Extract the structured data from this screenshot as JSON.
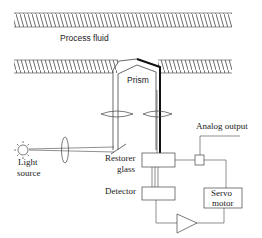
{
  "diagram": {
    "type": "refractometer schematic",
    "labels": {
      "process_fluid": "Process fluid",
      "prism": "Prism",
      "analog_output": "Analog output",
      "light_source_1": "Light",
      "light_source_2": "source",
      "restorer_1": "Restorer",
      "restorer_2": "glass",
      "detector": "Detector",
      "servo_1": "Servo",
      "servo_2": "motor"
    },
    "components": [
      "process-pipe-top-wall",
      "process-pipe-bottom-wall",
      "prism",
      "lens-left",
      "lens-right",
      "light-source",
      "condenser-lens",
      "mirror",
      "restorer-glass",
      "detector",
      "output-junction",
      "servo-motor",
      "amplifier"
    ],
    "colors": {
      "line": "#333333",
      "thick_beam": "#111111",
      "background": "#ffffff"
    }
  }
}
